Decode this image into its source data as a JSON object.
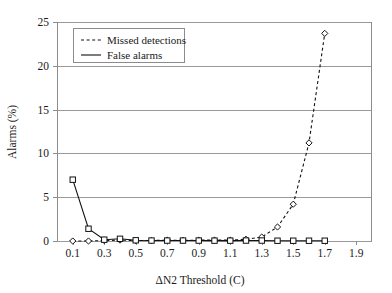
{
  "chart_data": {
    "type": "line",
    "title": "",
    "xlabel": "ΔN2 Threshold (C)",
    "ylabel": "Alarms (%)",
    "xlim": [
      0.0,
      2.0
    ],
    "ylim": [
      0,
      25
    ],
    "xticks": [
      0.1,
      0.3,
      0.5,
      0.7,
      0.9,
      1.1,
      1.3,
      1.5,
      1.7,
      1.9
    ],
    "xtick_labels": [
      "0.1",
      "0.3",
      "0.5",
      "0.7",
      "0.9",
      "1.1",
      "1.3",
      "1.5",
      "1.7",
      "1.9"
    ],
    "yticks": [
      0,
      5,
      10,
      15,
      20,
      25
    ],
    "ytick_labels": [
      "0",
      "5",
      "10",
      "15",
      "20",
      "25"
    ],
    "grid": "horizontal",
    "legend_position": "top-left",
    "x": [
      0.1,
      0.2,
      0.3,
      0.4,
      0.5,
      0.6,
      0.7,
      0.8,
      0.9,
      1.0,
      1.1,
      1.2,
      1.3,
      1.4,
      1.5,
      1.6,
      1.7
    ],
    "series": [
      {
        "name": "Missed detections",
        "style": "dashed",
        "marker": "diamond",
        "color": "#111111",
        "values": [
          0.0,
          0.0,
          0.05,
          0.1,
          0.05,
          0.05,
          0.1,
          0.08,
          0.1,
          0.1,
          0.1,
          0.2,
          0.45,
          1.6,
          4.2,
          11.2,
          23.7
        ]
      },
      {
        "name": "False alarms",
        "style": "solid",
        "marker": "square",
        "color": "#111111",
        "values": [
          7.0,
          1.4,
          0.15,
          0.25,
          0.08,
          0.05,
          0.05,
          0.05,
          0.05,
          0.04,
          0.04,
          0.05,
          0.05,
          0.03,
          0.03,
          0.03,
          0.03
        ]
      }
    ]
  },
  "legend": {
    "entries": [
      {
        "label": "Missed detections",
        "style": "dashed"
      },
      {
        "label": "False alarms",
        "style": "solid"
      }
    ]
  }
}
